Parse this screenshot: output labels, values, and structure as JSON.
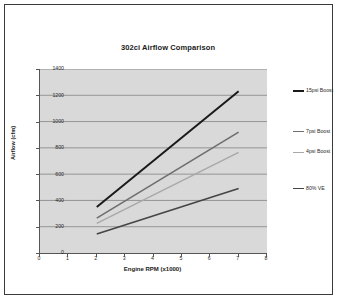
{
  "chart_data": {
    "type": "line",
    "title": "302ci Airflow Comparison",
    "xlabel": "Engine RPM (x1000)",
    "ylabel": "Airflow (cfm)",
    "xlim": [
      0,
      8
    ],
    "ylim": [
      0,
      1400
    ],
    "xticks": [
      "0",
      "1",
      "2",
      "3",
      "4",
      "5",
      "6",
      "7",
      "8"
    ],
    "yticks": [
      "0",
      "200",
      "400",
      "600",
      "800",
      "1000",
      "1200",
      "1400"
    ],
    "grid": "horizontal",
    "legend_position": "right",
    "plot_background": "#d9d9d9",
    "x": [
      2,
      7
    ],
    "series": [
      {
        "name": "15psi Boost",
        "values": [
          350,
          1230
        ],
        "color": "#1a1a1a",
        "width": 2.0
      },
      {
        "name": "7psi Boost",
        "values": [
          265,
          920
        ],
        "color": "#6e6e6e",
        "width": 1.6
      },
      {
        "name": "4psi Boost",
        "values": [
          225,
          765
        ],
        "color": "#a8a8a8",
        "width": 1.4
      },
      {
        "name": "80% VE",
        "values": [
          145,
          490
        ],
        "color": "#454545",
        "width": 1.6
      }
    ]
  }
}
